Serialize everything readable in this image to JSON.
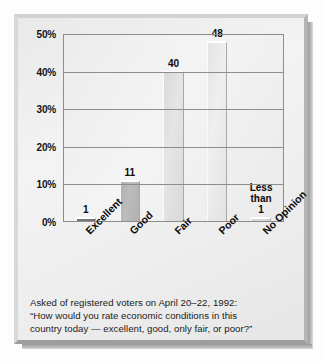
{
  "chart_data": {
    "type": "bar",
    "title": "",
    "subtitle": "",
    "xlabel": "",
    "ylabel": "",
    "categories": [
      "Excellent",
      "Good",
      "Fair",
      "Poor",
      "No Opinion"
    ],
    "values": [
      1,
      11,
      40,
      48,
      0.5
    ],
    "value_labels": [
      "1",
      "11",
      "40",
      "48",
      "Less\nthan\n1"
    ],
    "ylim": [
      0,
      50
    ],
    "ytick_labels": [
      "0%",
      "10%",
      "20%",
      "30%",
      "40%",
      "50%"
    ],
    "ytick_values": [
      0,
      10,
      20,
      30,
      40,
      50
    ],
    "grid": true,
    "legend": "none",
    "bar_colors": [
      "#6f6f6f",
      "#b0b0b0",
      "#d9d9d9",
      "#e3e3e3",
      "#d0d0d0"
    ],
    "annotations": [
      "Less than 1"
    ]
  },
  "caption": {
    "line1": "Asked of registered voters on April 20–22, 1992:",
    "line2": "“How would you rate economic conditions in this",
    "line3": "country today — excellent, good, only fair, or poor?”"
  }
}
